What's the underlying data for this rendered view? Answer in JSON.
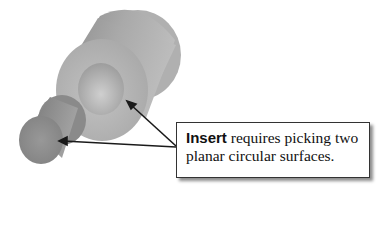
{
  "figure": {
    "callout": {
      "keyword": "Insert",
      "text_line1_rest": " requires picking two",
      "text_line2": "planar circular surfaces."
    },
    "colors": {
      "body_gray": "#a8a8a8",
      "face_gray": "#b9b9b9",
      "hole_gray": "#c4c4c4",
      "small_cyl_gray": "#8f8f8f",
      "arrow": "#1a1a1a",
      "box_border": "#333333"
    }
  }
}
